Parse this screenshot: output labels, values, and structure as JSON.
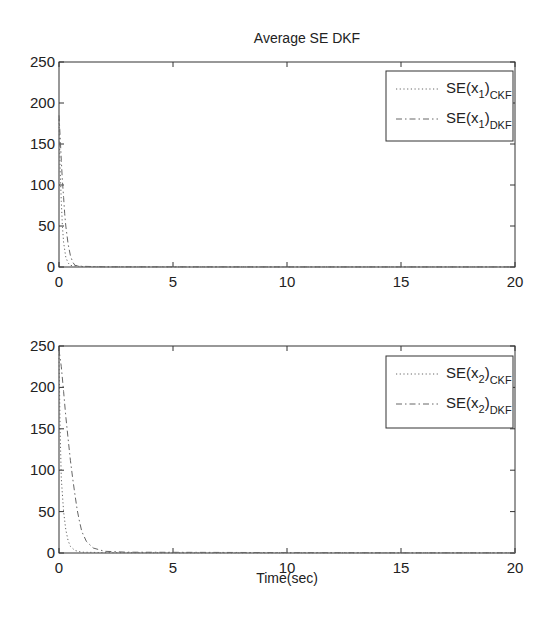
{
  "figure": {
    "title": "Average SE DKF",
    "xlabel": "Time(sec)"
  },
  "chart_data": [
    {
      "type": "line",
      "title": "Average SE DKF",
      "xlabel": "",
      "ylabel": "",
      "xlim": [
        0,
        20
      ],
      "ylim": [
        0,
        250
      ],
      "xticks": [
        0,
        5,
        10,
        15,
        20
      ],
      "yticks": [
        0,
        50,
        100,
        150,
        200,
        250
      ],
      "grid": false,
      "legend_position": "upper right",
      "series": [
        {
          "name": "SE(x1)CKF",
          "label_main": "SE(x",
          "label_index": "1",
          "label_close": ")",
          "label_sub": "CKF",
          "style": "dotted",
          "x": [
            0,
            0.05,
            0.1,
            0.15,
            0.2,
            0.3,
            0.4,
            0.5,
            1,
            2,
            5,
            10,
            15,
            20
          ],
          "y": [
            180,
            120,
            80,
            50,
            30,
            12,
            5,
            2,
            0.5,
            0.2,
            0.1,
            0.1,
            0.1,
            0.1
          ]
        },
        {
          "name": "SE(x1)DKF",
          "label_main": "SE(x",
          "label_index": "1",
          "label_close": ")",
          "label_sub": "DKF",
          "style": "dashdot",
          "x": [
            0,
            0.05,
            0.1,
            0.15,
            0.2,
            0.25,
            0.3,
            0.4,
            0.5,
            0.6,
            0.7,
            1,
            2,
            5,
            10,
            15,
            20
          ],
          "y": [
            185,
            160,
            130,
            105,
            85,
            65,
            50,
            28,
            14,
            6,
            2,
            0.8,
            0.3,
            0.2,
            0.1,
            0.1,
            0.1
          ]
        }
      ]
    },
    {
      "type": "line",
      "title": "",
      "xlabel": "Time(sec)",
      "ylabel": "",
      "xlim": [
        0,
        20
      ],
      "ylim": [
        0,
        250
      ],
      "xticks": [
        0,
        5,
        10,
        15,
        20
      ],
      "yticks": [
        0,
        50,
        100,
        150,
        200,
        250
      ],
      "grid": false,
      "legend_position": "upper right",
      "series": [
        {
          "name": "SE(x2)CKF",
          "label_main": "SE(x",
          "label_index": "2",
          "label_close": ")",
          "label_sub": "CKF",
          "style": "dotted",
          "x": [
            0,
            0.05,
            0.1,
            0.2,
            0.3,
            0.4,
            0.5,
            0.7,
            1,
            2,
            5,
            10,
            15,
            20
          ],
          "y": [
            240,
            150,
            90,
            50,
            28,
            15,
            8,
            3,
            1,
            0.5,
            0.3,
            0.2,
            0.2,
            0.2
          ]
        },
        {
          "name": "SE(x2)DKF",
          "label_main": "SE(x",
          "label_index": "2",
          "label_close": ")",
          "label_sub": "DKF",
          "style": "dashdot",
          "x": [
            0,
            0.1,
            0.2,
            0.3,
            0.4,
            0.5,
            0.6,
            0.7,
            0.8,
            0.9,
            1.0,
            1.2,
            1.5,
            2,
            3,
            5,
            10,
            15,
            20
          ],
          "y": [
            245,
            225,
            195,
            165,
            138,
            112,
            90,
            70,
            52,
            38,
            26,
            14,
            6,
            2,
            1,
            0.8,
            0.5,
            0.3,
            0.3
          ]
        }
      ]
    }
  ]
}
